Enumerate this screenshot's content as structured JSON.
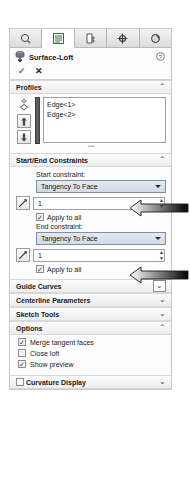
{
  "panel": {
    "title": "Surface-Loft",
    "title_icon": "surface-loft-icon",
    "help_icon": "help-icon",
    "accept_icon": "checkmark-icon",
    "cancel_icon": "close-x-icon"
  },
  "tabs": [
    {
      "name": "feature-manager-tree-tab",
      "icon": "tree-rollback-icon",
      "active": false
    },
    {
      "name": "property-manager-tab",
      "icon": "property-list-icon",
      "active": true
    },
    {
      "name": "configuration-manager-tab",
      "icon": "configuration-icon",
      "active": false
    },
    {
      "name": "dimxpert-manager-tab",
      "icon": "dimxpert-crosshair-icon",
      "active": false
    },
    {
      "name": "display-manager-tab",
      "icon": "display-sphere-icon",
      "active": false
    }
  ],
  "profiles": {
    "header": "Profiles",
    "collapsed": false,
    "chevron": "⌃",
    "select_icon": "profile-select-icon",
    "move_up_icon": "arrow-up-icon",
    "move_down_icon": "arrow-down-icon",
    "items": [
      "Edge<1>",
      "Edge<2>"
    ]
  },
  "start_end_constraints": {
    "header": "Start/End Constraints",
    "collapsed": false,
    "chevron": "⌃",
    "start": {
      "label": "Start constraint:",
      "value": "Tangency To Face",
      "tangent_icon": "tangent-direction-icon",
      "magnitude": "1",
      "apply_to_all_label": "Apply to all",
      "apply_to_all_checked": true
    },
    "end": {
      "label": "End constraint:",
      "value": "Tangency To Face",
      "tangent_icon": "tangent-direction-icon",
      "magnitude": "1",
      "apply_to_all_label": "Apply to all",
      "apply_to_all_checked": true
    }
  },
  "collapsed_sections": [
    {
      "name": "guide-curves",
      "label": "Guide Curves",
      "chevron": "⌄",
      "boxed": true
    },
    {
      "name": "centerline-parameters",
      "label": "Centerline Parameters",
      "chevron": "⌄",
      "boxed": false
    },
    {
      "name": "sketch-tools",
      "label": "Sketch Tools",
      "chevron": "⌄",
      "boxed": false
    }
  ],
  "options": {
    "header": "Options",
    "chevron": "⌃",
    "items": [
      {
        "name": "merge-tangent-faces",
        "label": "Merge tangent faces",
        "checked": true
      },
      {
        "name": "close-loft",
        "label": "Close loft",
        "checked": false
      },
      {
        "name": "show-preview",
        "label": "Show preview",
        "checked": true
      }
    ]
  },
  "curvature_display": {
    "label": "Curvature Display",
    "chevron": "⌄",
    "checked": false
  },
  "annotations": [
    {
      "name": "start-constraint-callout-arrow"
    },
    {
      "name": "end-constraint-callout-arrow"
    }
  ],
  "check_glyph": "✓"
}
